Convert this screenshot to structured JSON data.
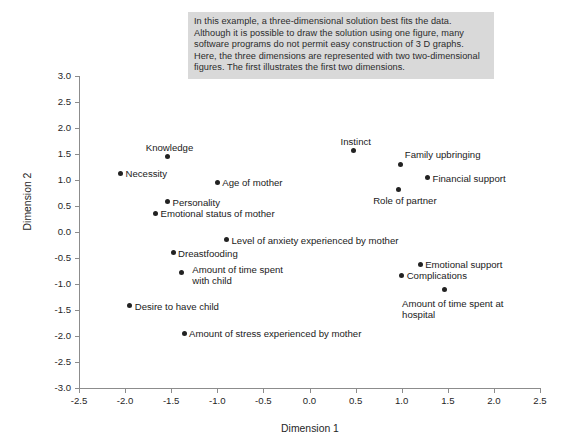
{
  "note": {
    "text": "In this example, a three-dimensional solution best fits the data. Although it is possible to draw the solution using one figure, many software programs do not permit easy construction of 3 D graphs. Here, the three dimensions are represented with two two-dimensional figures. The first illustrates the first two dimensions.",
    "background": "#d9d9d9"
  },
  "chart_data": {
    "type": "scatter",
    "title": "",
    "xlabel": "Dimension 1",
    "ylabel": "Dimension 2",
    "xlim": [
      -2.5,
      2.5
    ],
    "ylim": [
      -3.0,
      3.0
    ],
    "xticks": [
      "-2.5",
      "-2.0",
      "-1.5",
      "-1.0",
      "-0.5",
      "0.0",
      "0.5",
      "1.0",
      "1.5",
      "2.0",
      "2.5"
    ],
    "xtick_values": [
      -2.5,
      -2.0,
      -1.5,
      -1.0,
      -0.5,
      0.0,
      0.5,
      1.0,
      1.5,
      2.0,
      2.5
    ],
    "yticks": [
      "3.0",
      "2.5",
      "2.0",
      "1.5",
      "1.0",
      "0.5",
      "0.0",
      "-0.5",
      "-1.0",
      "-1.5",
      "-2.0",
      "-2.5",
      "-3.0"
    ],
    "ytick_values": [
      3.0,
      2.5,
      2.0,
      1.5,
      1.0,
      0.5,
      0.0,
      -0.5,
      -1.0,
      -1.5,
      -2.0,
      -2.5,
      -3.0
    ],
    "grid": false,
    "legend": false,
    "marker_color": "#222222",
    "points": [
      {
        "label": "Knowledge",
        "x": -1.54,
        "y": 1.45,
        "pos": "above"
      },
      {
        "label": "Necessity",
        "x": -2.05,
        "y": 1.13,
        "pos": "right"
      },
      {
        "label": "Age of mother",
        "x": -1.0,
        "y": 0.96,
        "pos": "right"
      },
      {
        "label": "Personality",
        "x": -1.54,
        "y": 0.58,
        "pos": "right"
      },
      {
        "label": "Emotional status of mother",
        "x": -1.67,
        "y": 0.36,
        "pos": "right"
      },
      {
        "label": "Level of anxiety experienced by mother",
        "x": -0.9,
        "y": -0.15,
        "pos": "right"
      },
      {
        "label": "Dreastfooding",
        "x": -1.48,
        "y": -0.4,
        "pos": "right"
      },
      {
        "label": "Amount of time spent\nwith child",
        "x": -1.39,
        "y": -0.78,
        "pos": "right-multi"
      },
      {
        "label": "Desire to have child",
        "x": -1.95,
        "y": -1.42,
        "pos": "right"
      },
      {
        "label": "Amount of stress experienced by mother",
        "x": -1.36,
        "y": -1.95,
        "pos": "right"
      },
      {
        "label": "Instinct",
        "x": 0.48,
        "y": 1.56,
        "pos": "above"
      },
      {
        "label": "Family upbringing",
        "x": 0.99,
        "y": 1.3,
        "pos": "above-right"
      },
      {
        "label": "Financial support",
        "x": 1.28,
        "y": 1.04,
        "pos": "right"
      },
      {
        "label": "Role of partner",
        "x": 0.97,
        "y": 0.81,
        "pos": "below"
      },
      {
        "label": "Emotional support",
        "x": 1.2,
        "y": -0.62,
        "pos": "right"
      },
      {
        "label": "Complications",
        "x": 1.0,
        "y": -0.83,
        "pos": "right"
      },
      {
        "label": "Amount of time spent at\nhospital",
        "x": 1.46,
        "y": -1.1,
        "pos": "below-multi"
      }
    ]
  }
}
